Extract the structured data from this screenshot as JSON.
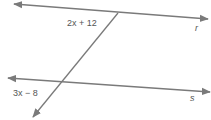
{
  "figure": {
    "line_color": "#7a7a7a",
    "lines": [
      {
        "id": "r",
        "label": "r"
      },
      {
        "id": "s",
        "label": "s"
      },
      {
        "id": "transversal",
        "label": ""
      }
    ],
    "angles": [
      {
        "id": "angle-top",
        "expression": "2x + 12",
        "at_line": "r"
      },
      {
        "id": "angle-bottom",
        "expression": "3x − 8",
        "at_line": "s"
      }
    ]
  }
}
